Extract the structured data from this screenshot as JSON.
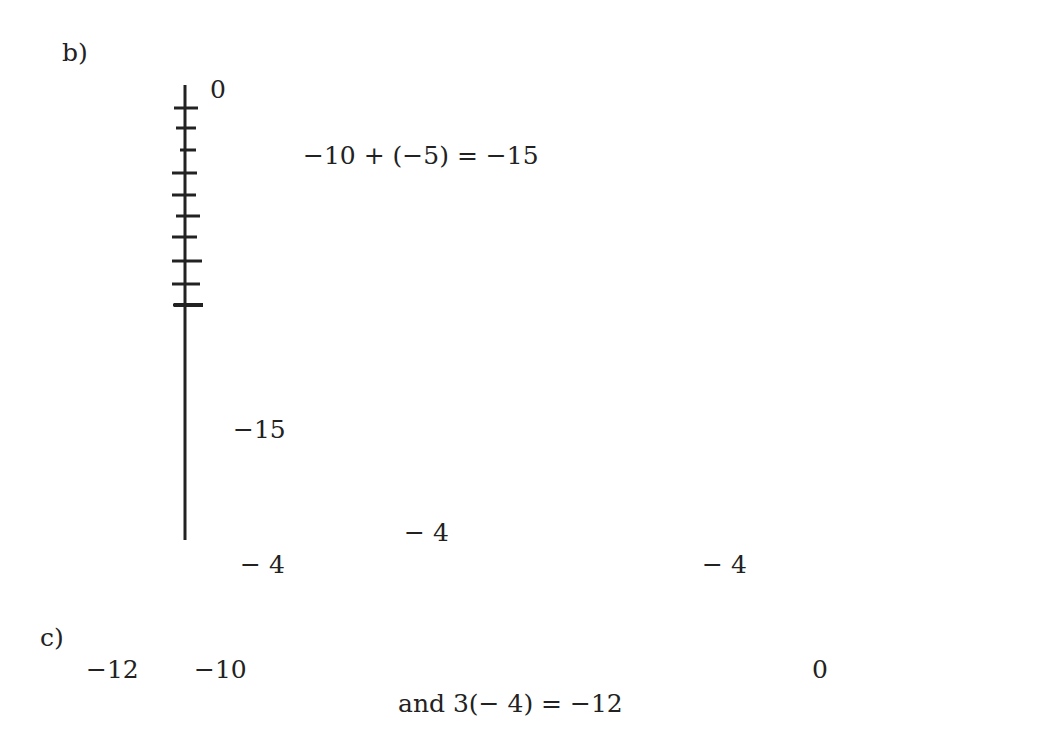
{
  "part_b": {
    "label": "b)",
    "equation": "−10 + (−5) = −15",
    "top_label": "0",
    "end_label": "−15",
    "start": 0,
    "jumps": [
      -10,
      -5
    ],
    "result": -15,
    "orientation": "vertical"
  },
  "part_c": {
    "label": "c)",
    "equation": "and 3(− 4) = −12",
    "tick_labels": [
      {
        "value": -12,
        "text": "−12"
      },
      {
        "value": -10,
        "text": "−10"
      },
      {
        "value": 0,
        "text": "0"
      }
    ],
    "jump_labels": [
      "− 4",
      "− 4",
      "− 4"
    ],
    "start": 0,
    "jump": -4,
    "count": 3,
    "result": -12,
    "axis_range": [
      -12,
      3
    ],
    "orientation": "horizontal"
  },
  "colors": {
    "ink": "#222222",
    "background": "#ffffff"
  }
}
